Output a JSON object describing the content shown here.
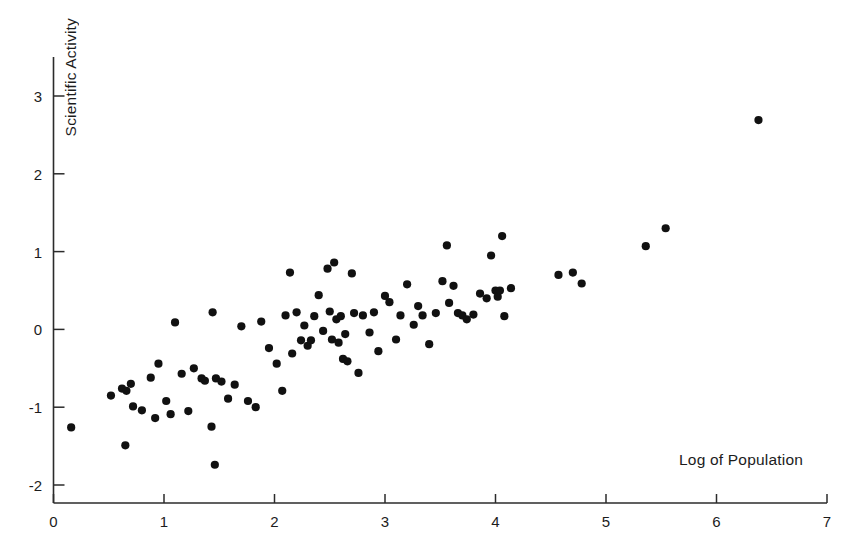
{
  "chart_data": {
    "type": "scatter",
    "title": "",
    "xlabel": "Log of Population",
    "ylabel": "Scientific Activity",
    "xlim": [
      0,
      7
    ],
    "ylim": [
      -2,
      3.5
    ],
    "xticks": [
      0,
      1,
      2,
      3,
      4,
      5,
      6,
      7
    ],
    "xtick_labels": [
      "0",
      "1",
      "2",
      "3",
      "4",
      "5",
      "6",
      "7"
    ],
    "yticks": [
      -2,
      -1,
      0,
      1,
      2,
      3
    ],
    "ytick_labels": [
      "-2",
      "-1",
      "0",
      "1",
      "2",
      "3"
    ],
    "grid": false,
    "legend": null,
    "marker": {
      "shape": "circle",
      "color": "#111111",
      "size_px": 6
    },
    "axis_color": "#2b2b2b",
    "background": "#ffffff",
    "n_points": 94,
    "points": [
      [
        0.16,
        -1.26
      ],
      [
        0.52,
        -0.85
      ],
      [
        0.62,
        -0.76
      ],
      [
        0.65,
        -1.49
      ],
      [
        0.66,
        -0.79
      ],
      [
        0.7,
        -0.7
      ],
      [
        0.72,
        -0.99
      ],
      [
        0.8,
        -1.04
      ],
      [
        0.88,
        -0.62
      ],
      [
        0.92,
        -1.14
      ],
      [
        0.95,
        -0.44
      ],
      [
        1.02,
        -0.92
      ],
      [
        1.06,
        -1.09
      ],
      [
        1.1,
        0.09
      ],
      [
        1.16,
        -0.57
      ],
      [
        1.22,
        -1.05
      ],
      [
        1.27,
        -0.5
      ],
      [
        1.34,
        -0.63
      ],
      [
        1.37,
        -0.66
      ],
      [
        1.43,
        -1.25
      ],
      [
        1.44,
        0.22
      ],
      [
        1.46,
        -1.74
      ],
      [
        1.47,
        -0.63
      ],
      [
        1.52,
        -0.67
      ],
      [
        1.58,
        -0.89
      ],
      [
        1.64,
        -0.71
      ],
      [
        1.7,
        0.04
      ],
      [
        1.76,
        -0.92
      ],
      [
        1.83,
        -1.0
      ],
      [
        1.88,
        0.1
      ],
      [
        1.95,
        -0.24
      ],
      [
        2.02,
        -0.44
      ],
      [
        2.07,
        -0.79
      ],
      [
        2.1,
        0.18
      ],
      [
        2.14,
        0.73
      ],
      [
        2.16,
        -0.31
      ],
      [
        2.2,
        0.22
      ],
      [
        2.24,
        -0.14
      ],
      [
        2.27,
        0.05
      ],
      [
        2.3,
        -0.21
      ],
      [
        2.33,
        -0.14
      ],
      [
        2.36,
        0.17
      ],
      [
        2.4,
        0.44
      ],
      [
        2.44,
        -0.02
      ],
      [
        2.48,
        0.78
      ],
      [
        2.5,
        0.23
      ],
      [
        2.52,
        -0.13
      ],
      [
        2.54,
        0.86
      ],
      [
        2.56,
        0.13
      ],
      [
        2.58,
        -0.17
      ],
      [
        2.6,
        0.17
      ],
      [
        2.62,
        -0.38
      ],
      [
        2.64,
        -0.06
      ],
      [
        2.66,
        -0.41
      ],
      [
        2.7,
        0.72
      ],
      [
        2.72,
        0.21
      ],
      [
        2.76,
        -0.56
      ],
      [
        2.8,
        0.18
      ],
      [
        2.86,
        -0.04
      ],
      [
        2.9,
        0.22
      ],
      [
        2.94,
        -0.28
      ],
      [
        3.0,
        0.43
      ],
      [
        3.04,
        0.35
      ],
      [
        3.1,
        -0.13
      ],
      [
        3.14,
        0.18
      ],
      [
        3.2,
        0.58
      ],
      [
        3.26,
        0.06
      ],
      [
        3.3,
        0.3
      ],
      [
        3.34,
        0.18
      ],
      [
        3.4,
        -0.19
      ],
      [
        3.46,
        0.21
      ],
      [
        3.52,
        0.62
      ],
      [
        3.56,
        1.08
      ],
      [
        3.58,
        0.34
      ],
      [
        3.62,
        0.56
      ],
      [
        3.66,
        0.21
      ],
      [
        3.7,
        0.18
      ],
      [
        3.74,
        0.13
      ],
      [
        3.8,
        0.19
      ],
      [
        3.86,
        0.46
      ],
      [
        3.92,
        0.4
      ],
      [
        3.96,
        0.95
      ],
      [
        4.0,
        0.5
      ],
      [
        4.02,
        0.42
      ],
      [
        4.04,
        0.5
      ],
      [
        4.06,
        1.2
      ],
      [
        4.08,
        0.17
      ],
      [
        4.14,
        0.53
      ],
      [
        4.57,
        0.7
      ],
      [
        4.7,
        0.73
      ],
      [
        4.78,
        0.59
      ],
      [
        5.36,
        1.07
      ],
      [
        5.54,
        1.3
      ],
      [
        6.38,
        2.69
      ]
    ]
  }
}
